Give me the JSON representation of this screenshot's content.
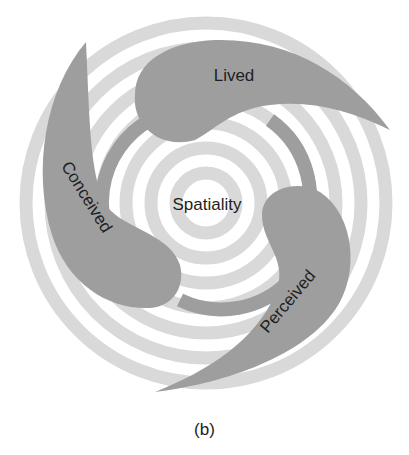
{
  "figure": {
    "center_label": "Spatiality",
    "segments": [
      {
        "id": "lived",
        "label": "Lived"
      },
      {
        "id": "conceived",
        "label": "Conceived"
      },
      {
        "id": "perceived",
        "label": "Perceived"
      }
    ],
    "caption": "(b)",
    "colors": {
      "segment": "#9e9e9e",
      "ring": "#d9d9d9",
      "background": "#ffffff",
      "text": "#1e1e1e"
    }
  }
}
